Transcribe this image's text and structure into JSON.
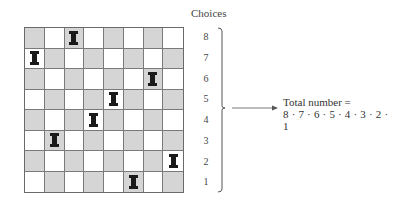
{
  "diagram": {
    "board": {
      "size": 8,
      "colors": {
        "light": "#ffffff",
        "dark": "#d5d5d5",
        "grid": "#7a7a7a",
        "rook": "#1a1a1a"
      },
      "rooks": [
        {
          "row": 0,
          "col": 2
        },
        {
          "row": 1,
          "col": 0
        },
        {
          "row": 2,
          "col": 6
        },
        {
          "row": 3,
          "col": 4
        },
        {
          "row": 4,
          "col": 3
        },
        {
          "row": 5,
          "col": 1
        },
        {
          "row": 6,
          "col": 7
        },
        {
          "row": 7,
          "col": 5
        }
      ]
    },
    "choices": {
      "label": "Choices",
      "values": [
        "8",
        "7",
        "6",
        "5",
        "4",
        "3",
        "2",
        "1"
      ]
    },
    "total": {
      "label": "Total number =",
      "formula": "8 · 7 · 6 · 5 · 4 · 3 · 2 · 1"
    }
  }
}
